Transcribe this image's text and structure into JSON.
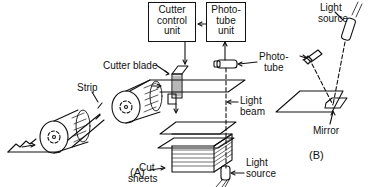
{
  "diagram": {
    "type": "technical line drawing",
    "panels": [
      {
        "id": "A",
        "label": "(A)",
        "components": {
          "cutter_control_unit": [
            "Cutter",
            "control",
            "unit"
          ],
          "phototube_unit": [
            "Photo-",
            "tube",
            "unit"
          ],
          "cutter_blade": "Cutter blade",
          "strip": "Strip",
          "phototube": [
            "Photo-",
            "tube"
          ],
          "light_beam": [
            "Light",
            "beam"
          ],
          "cut_sheets": [
            "Cut",
            "sheets"
          ],
          "light_source": [
            "Light",
            "source"
          ]
        }
      },
      {
        "id": "B",
        "label": "(B)",
        "components": {
          "light_source": [
            "Light",
            "source"
          ],
          "mirror": "Mirror"
        }
      }
    ],
    "connections": [
      {
        "from": "Photo-tube unit",
        "to": "Cutter control unit"
      },
      {
        "from": "Cutter control unit",
        "to": "Cutter blade"
      },
      {
        "from": "Phototube",
        "to": "Photo-tube unit"
      }
    ]
  }
}
